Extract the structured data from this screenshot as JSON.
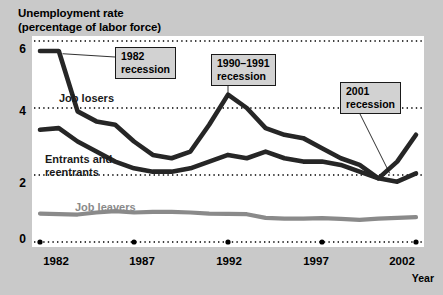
{
  "title": {
    "line1": "Unemployment rate",
    "line2": "(percentage of labor force)"
  },
  "axis": {
    "x_label": "Year",
    "y_ticks": [
      "0",
      "2",
      "4",
      "6"
    ],
    "x_ticks": [
      "1982",
      "1987",
      "1992",
      "1997",
      "2002"
    ]
  },
  "series_labels": {
    "job_losers": "Job losers",
    "entrants_line1": "Entrants and",
    "entrants_line2": "reentrants",
    "job_leavers": "Job leavers"
  },
  "callouts": {
    "rec1982_line1": "1982",
    "rec1982_line2": "recession",
    "rec1990_line1": "1990–1991",
    "rec1990_line2": "recession",
    "rec2001_line1": "2001",
    "rec2001_line2": "recession"
  },
  "colors": {
    "background": "#c9c9c9",
    "plot_background": "#ffffff",
    "job_losers": "#262626",
    "entrants": "#262626",
    "job_leavers": "#8a8a8a",
    "gridline": "#000000",
    "callout_fill": "#d2d2d2",
    "callout_border": "#1a1a1a"
  },
  "chart_data": {
    "type": "line",
    "title": "Unemployment rate (percentage of labor force)",
    "xlabel": "Year",
    "ylabel": "Unemployment rate (percentage of labor force)",
    "xlim": [
      1982,
      2002
    ],
    "ylim": [
      0,
      6
    ],
    "grid": true,
    "gridlines_y": [
      0,
      2,
      4,
      6
    ],
    "legend": "inline-labels",
    "x": [
      1982,
      1983,
      1984,
      1985,
      1986,
      1987,
      1988,
      1989,
      1990,
      1991,
      1992,
      1993,
      1994,
      1995,
      1996,
      1997,
      1998,
      1999,
      2000,
      2001,
      2002
    ],
    "series": [
      {
        "name": "Job losers",
        "color": "#262626",
        "values": [
          5.7,
          5.7,
          3.9,
          3.6,
          3.5,
          3.0,
          2.6,
          2.5,
          2.7,
          3.5,
          4.4,
          4.0,
          3.4,
          3.2,
          3.1,
          2.8,
          2.5,
          2.3,
          1.9,
          2.4,
          3.2
        ]
      },
      {
        "name": "Entrants and reentrants",
        "color": "#262626",
        "values": [
          3.35,
          3.4,
          3.0,
          2.7,
          2.4,
          2.2,
          2.1,
          2.1,
          2.2,
          2.4,
          2.6,
          2.5,
          2.7,
          2.5,
          2.4,
          2.4,
          2.3,
          2.1,
          1.9,
          1.8,
          2.05
        ]
      },
      {
        "name": "Job leavers",
        "color": "#8a8a8a",
        "values": [
          0.85,
          0.83,
          0.82,
          0.88,
          0.92,
          0.88,
          0.9,
          0.9,
          0.88,
          0.85,
          0.84,
          0.83,
          0.72,
          0.7,
          0.7,
          0.71,
          0.69,
          0.66,
          0.7,
          0.72,
          0.74
        ]
      }
    ],
    "annotations": [
      {
        "text": "1982 recession",
        "points_to_year": 1983,
        "points_to_value": 5.7
      },
      {
        "text": "1990–1991 recession",
        "points_to_year": 1992,
        "points_to_value": 4.4
      },
      {
        "text": "2001 recession",
        "points_to_year": 2001,
        "points_to_value": 1.95
      }
    ]
  }
}
